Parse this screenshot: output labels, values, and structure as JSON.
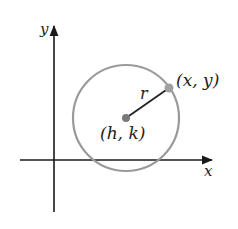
{
  "diagram": {
    "axes": {
      "x_label": "x",
      "y_label": "y"
    },
    "circle": {
      "center_label": "(h, k)",
      "point_label": "(x, y)",
      "radius_label": "r"
    },
    "colors": {
      "axis": "#1a1a1a",
      "circle": "#9a9a9a",
      "radius_line": "#222222",
      "center_point": "#7a7a7a",
      "edge_point": "#9a9a9a",
      "text": "#222222"
    }
  }
}
